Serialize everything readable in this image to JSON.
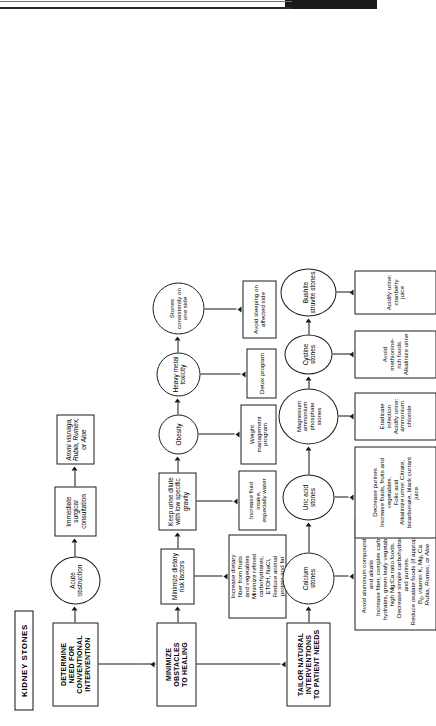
{
  "document": {
    "title": "KIDNEY STONES",
    "type": "clinical treatment flowchart",
    "orientation": "page rotated 90 degrees counter-clockwise"
  },
  "stages": {
    "determine": "DETERMINE\nNEED FOR\nCONVENTIONAL\nINTERVENTION",
    "minimize": "MINIMIZE\nOBSTACLES\nTO HEALING",
    "tailor": "TAILOR NATURAL\nINTERVENTIONS\nTO PATIENT NEEDS"
  },
  "row_conventional": {
    "acute": "Acute\nobstruction",
    "surgical": "Immediate\nsurgical\nconsultation",
    "herbs": "Ammi visnaga,\nRubia, Rumex,\nor Aloe"
  },
  "row_obstacles": [
    {
      "node": "Minimize dietary\nrisk factors",
      "action": "Increase dietary\nfiber from fruits\nand vegetables\nMinimize refined\ncarbohydrates,\nETOH, NaCl,\nReduce animal\nprotein and fat"
    },
    {
      "node": "Keep urine dilute\nwith low specific\ngravity",
      "action": "Increase fluid intake,\nespecially water"
    },
    {
      "node": "Obesity",
      "action": "Weight management\nprogram"
    },
    {
      "node": "Heavy metal\ntoxicity",
      "action": "Detox program"
    },
    {
      "node": "Stones\nconsistently on\none side",
      "action": "Avoid sleeping on\naffected side"
    }
  ],
  "row_stones": [
    {
      "stone": "Calcium\nstones",
      "treatment_lines": [
        "Avoid aluminum compounds",
        "and alkalis",
        "Increase fiber, complex carbo-",
        "hydrates, green leafy vegetables,",
        "high Mg:Ca ratio foods.",
        "Decrease simple carbohydrates",
        "and purines.",
        "Reduce oxalate foods (if appropriate)",
        "B6, vitamin K, Mg, Ca",
        "Rubia, Rumex, or Aloe"
      ],
      "italic_last_line": true
    },
    {
      "stone": "Uric acid\nstones",
      "treatment_lines": [
        "Decrease purines",
        "Increase fluids, fruits and vegetables.",
        "Folic acid",
        "Alkalinize urine: Citrate,",
        "bicarbonate, black currant juice."
      ],
      "italic_last_line": false
    },
    {
      "stone": "Magnesium\nammonium\nphosphate\nstones",
      "treatment_lines": [
        "Eradicate infection",
        "Acidify urine: ammonium chloride"
      ],
      "italic_last_line": false
    },
    {
      "stone": "Cystine\nstones",
      "treatment_lines": [
        "Avoid methionine-rich foods.",
        "Alkalinize urine"
      ],
      "italic_last_line": false
    },
    {
      "stone": "Bushite\nstruvite stones",
      "treatment_lines": [
        "Acidify urine: cranberry juice"
      ],
      "italic_last_line": false
    }
  ],
  "colors": {
    "ink": "#151515",
    "paper": "#ffffff",
    "bar": "#1a1a1a"
  }
}
